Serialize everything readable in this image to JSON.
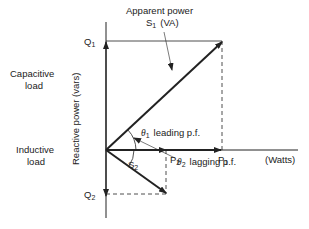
{
  "diagram": {
    "labels": {
      "apparent_power_line1": "Apparent power",
      "apparent_power_s": "S",
      "apparent_power_s_sub": "1",
      "apparent_power_unit": "(VA)",
      "q1": "Q",
      "q1_sub": "1",
      "q2": "Q",
      "q2_sub": "2",
      "p1": "P",
      "p1_sub": "1",
      "p2": "P",
      "p2_sub": "2",
      "s2": "S",
      "s2_sub": "2",
      "watts": "(Watts)",
      "capacitive_line1": "Capacitive",
      "capacitive_line2": "load",
      "inductive_line1": "Inductive",
      "inductive_line2": "load",
      "y_axis": "Reactive power (vars)",
      "theta1": "θ",
      "theta1_sub": "1",
      "theta1_text": "leading p.f.",
      "theta2": "θ",
      "theta2_sub": "2",
      "theta2_text": "lagging p.f."
    },
    "colors": {
      "ink": "#222222",
      "background": "#ffffff"
    }
  }
}
